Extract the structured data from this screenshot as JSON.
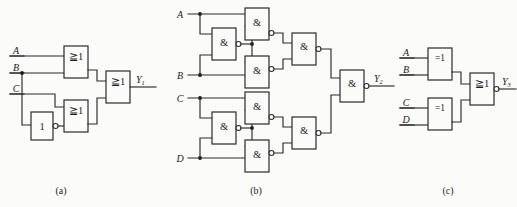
{
  "figure": {
    "background_color": "#fbfbf9",
    "line_color": "#2b2b2b"
  },
  "captions": {
    "a": "(a)",
    "b": "(b)",
    "c": "(c)"
  },
  "circuit_a": {
    "caption": "(a)",
    "inputs": [
      {
        "label": "A"
      },
      {
        "label": "B"
      },
      {
        "label": "C"
      }
    ],
    "output": {
      "label": "Y",
      "subscript": "1"
    },
    "gates": [
      {
        "id": "a-or1",
        "symbol": "≧1",
        "type": "or",
        "inverted": false
      },
      {
        "id": "a-not1",
        "symbol": "1",
        "type": "not",
        "inverted": true
      },
      {
        "id": "a-or2",
        "symbol": "≧1",
        "type": "or",
        "inverted": false
      },
      {
        "id": "a-or3",
        "symbol": "≧1",
        "type": "or",
        "inverted": false
      }
    ]
  },
  "circuit_b": {
    "caption": "(b)",
    "inputs": [
      {
        "label": "A"
      },
      {
        "label": "B"
      },
      {
        "label": "C"
      },
      {
        "label": "D"
      }
    ],
    "output": {
      "label": "Y",
      "subscript": "2"
    },
    "gates": [
      {
        "id": "b-nand-top-1",
        "symbol": "&",
        "type": "nand",
        "inverted": true
      },
      {
        "id": "b-nand-top-2",
        "symbol": "&",
        "type": "nand",
        "inverted": true
      },
      {
        "id": "b-nand-top-3",
        "symbol": "&",
        "type": "nand",
        "inverted": true
      },
      {
        "id": "b-nand-top-4",
        "symbol": "&",
        "type": "nand",
        "inverted": true
      },
      {
        "id": "b-nand-bot-1",
        "symbol": "&",
        "type": "nand",
        "inverted": true
      },
      {
        "id": "b-nand-bot-2",
        "symbol": "&",
        "type": "nand",
        "inverted": true
      },
      {
        "id": "b-nand-bot-3",
        "symbol": "&",
        "type": "nand",
        "inverted": true
      },
      {
        "id": "b-nand-bot-4",
        "symbol": "&",
        "type": "nand",
        "inverted": true
      },
      {
        "id": "b-nand-out",
        "symbol": "&",
        "type": "nand",
        "inverted": true
      }
    ]
  },
  "circuit_c": {
    "caption": "(c)",
    "inputs": [
      {
        "label": "A"
      },
      {
        "label": "B"
      },
      {
        "label": "C"
      },
      {
        "label": "D"
      }
    ],
    "output": {
      "label": "Y",
      "subscript": "3"
    },
    "gates": [
      {
        "id": "c-xor1",
        "symbol": "=1",
        "type": "xor",
        "inverted": false
      },
      {
        "id": "c-xor2",
        "symbol": "=1",
        "type": "xor",
        "inverted": false
      },
      {
        "id": "c-nor1",
        "symbol": "≧1",
        "type": "nor",
        "inverted": true
      }
    ]
  }
}
